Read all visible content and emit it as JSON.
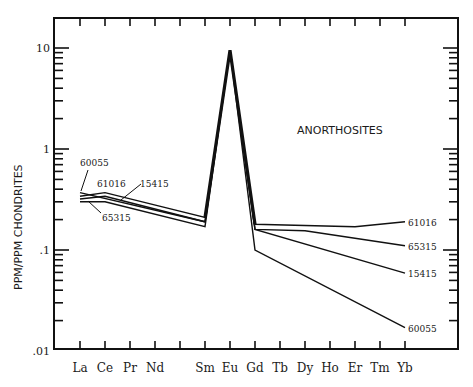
{
  "chart_data": {
    "type": "line",
    "title": "",
    "xlabel": "",
    "ylabel": "PPM/PPM CHONDRITES",
    "yscale": "log",
    "ylim": [
      0.01,
      20
    ],
    "y_ticks": [
      {
        "value": 10,
        "label": "10"
      },
      {
        "value": 1,
        "label": "1"
      },
      {
        "value": 0.1,
        "label": ".1"
      },
      {
        "value": 0.01,
        "label": ".01"
      }
    ],
    "categories": [
      "La",
      "Ce",
      "Pr",
      "Nd",
      "Pm",
      "Sm",
      "Eu",
      "Gd",
      "Tb",
      "Dy",
      "Ho",
      "Er",
      "Tm",
      "Yb"
    ],
    "category_labels": [
      "La",
      "Ce",
      "Pr",
      "Nd",
      "",
      "Sm",
      "Eu",
      "Gd",
      "Tb",
      "Dy",
      "Ho",
      "Er",
      "Tm",
      "Yb"
    ],
    "annotation": "ANORTHOSITES",
    "grid": false,
    "series": [
      {
        "name": "60055",
        "points": [
          {
            "x": "La",
            "y": 0.37
          },
          {
            "x": "Sm",
            "y": 0.19
          },
          {
            "x": "Eu",
            "y": 9.5
          },
          {
            "x": "Gd",
            "y": 0.1
          },
          {
            "x": "Yb",
            "y": 0.017
          }
        ]
      },
      {
        "name": "61016",
        "points": [
          {
            "x": "La",
            "y": 0.34
          },
          {
            "x": "Ce",
            "y": 0.37
          },
          {
            "x": "Sm",
            "y": 0.21
          },
          {
            "x": "Eu",
            "y": 9.5
          },
          {
            "x": "Gd",
            "y": 0.18
          },
          {
            "x": "Er",
            "y": 0.17
          },
          {
            "x": "Yb",
            "y": 0.19
          }
        ]
      },
      {
        "name": "15415",
        "points": [
          {
            "x": "La",
            "y": 0.32
          },
          {
            "x": "Ce",
            "y": 0.34
          },
          {
            "x": "Sm",
            "y": 0.19
          },
          {
            "x": "Eu",
            "y": 9.5
          },
          {
            "x": "Gd",
            "y": 0.16
          },
          {
            "x": "Yb",
            "y": 0.059
          }
        ]
      },
      {
        "name": "65315",
        "points": [
          {
            "x": "La",
            "y": 0.3
          },
          {
            "x": "Ce",
            "y": 0.3
          },
          {
            "x": "Sm",
            "y": 0.17
          },
          {
            "x": "Eu",
            "y": 9.5
          },
          {
            "x": "Gd",
            "y": 0.16
          },
          {
            "x": "Dy",
            "y": 0.155
          },
          {
            "x": "Yb",
            "y": 0.11
          }
        ]
      }
    ]
  }
}
